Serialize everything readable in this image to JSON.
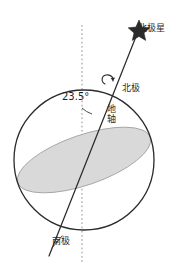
{
  "figure": {
    "background_color": "#ffffff",
    "stroke_color": "#2b2b2b",
    "plane_fill_color": "#d9d9d9",
    "plane_stroke_color": "#9a9a9a",
    "dotted_line_color": "#8e8e8e"
  },
  "labels": {
    "polaris": "北极星",
    "north_pole": "北极",
    "earth_axis": "地轴",
    "south_pole": "南极",
    "tilt_angle": "23.5°"
  },
  "icons": {
    "star": "star-icon",
    "rotation_arrow": "rotation-arrow-icon"
  },
  "caption": {
    "partial_text": ""
  },
  "geometry": {
    "sphere_center_x": 84,
    "sphere_center_y": 160,
    "sphere_radius": 70,
    "axis_tilt_degrees": 23.5,
    "vertical_line_x": 82,
    "vertical_line_top_y": 25,
    "vertical_line_bottom_y": 262,
    "star_x": 139,
    "star_y": 28
  }
}
